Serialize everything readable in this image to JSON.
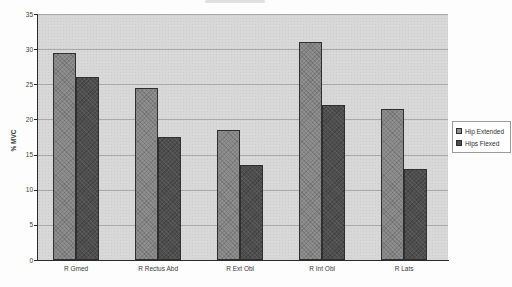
{
  "chart_data": {
    "type": "bar",
    "title": "",
    "xlabel": "",
    "ylabel": "% MVC",
    "categories": [
      "R Gmed",
      "R Rectus Abd",
      "R Ext Obl",
      "R Int Obl",
      "R Lats"
    ],
    "series": [
      {
        "name": "Hip Extended",
        "color": "#8f8f8f",
        "values": [
          29.5,
          24.5,
          18.5,
          31,
          21.5
        ]
      },
      {
        "name": "Hips Flexed",
        "color": "#4e4e4e",
        "values": [
          26,
          17.5,
          13.5,
          22,
          13
        ]
      }
    ],
    "ylim": [
      0,
      35
    ],
    "y_ticks": [
      0,
      5,
      10,
      15,
      20,
      25,
      30,
      35
    ],
    "grid": "horizontal",
    "gridline_color": "#a8a8a8",
    "plot_background": "#d8d8d8",
    "axis_color": "#2b2b2b",
    "legend_position": "right"
  },
  "legend": {
    "items": [
      {
        "label": "Hip Extended",
        "color": "#8f8f8f"
      },
      {
        "label": "Hips Flexed",
        "color": "#4e4e4e"
      }
    ]
  }
}
